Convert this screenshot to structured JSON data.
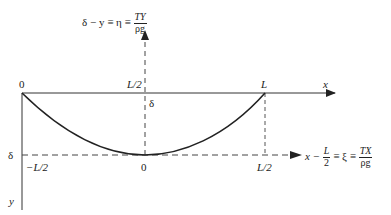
{
  "diagram": {
    "colors": {
      "line": "#222222",
      "dash": "#555555",
      "background": "#ffffff"
    },
    "top_axis_label": {
      "lhs": "δ − y ≡ η ≡",
      "num": "TY",
      "den": "ρg"
    },
    "right_axis_label": {
      "lhs": "x −",
      "half_num": "L",
      "half_den": "2",
      "mid": "≡ ξ ≡",
      "num": "TX",
      "den": "ρg"
    },
    "labels": {
      "origin_top_left": "0",
      "top_half": "L/2",
      "top_L": "L",
      "x_axis": "x",
      "sag_delta_center": "δ",
      "left_delta": "δ",
      "bottom_neg_half": "−L/2",
      "bottom_zero": "0",
      "bottom_half": "L/2",
      "y_axis": "y"
    }
  }
}
